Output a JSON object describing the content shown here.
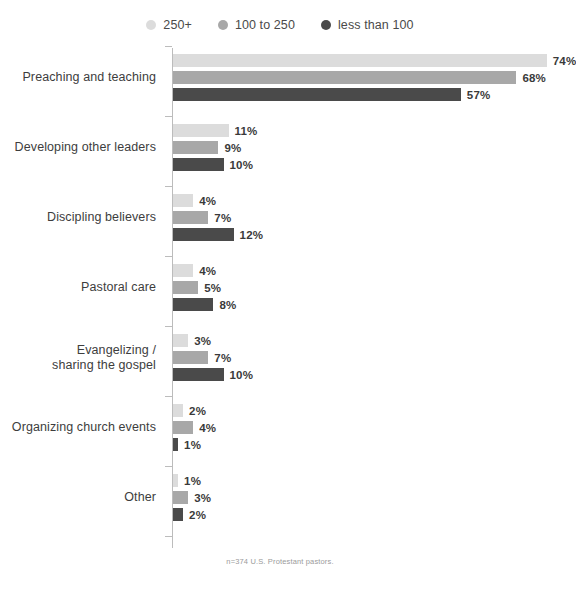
{
  "chart_data": {
    "type": "bar",
    "orientation": "horizontal",
    "title": "",
    "xlabel": "",
    "ylabel": "",
    "xlim": [
      0,
      80
    ],
    "grid": false,
    "legend_position": "top-center",
    "categories": [
      "Preaching and teaching",
      "Developing other leaders",
      "Discipling believers",
      "Pastoral care",
      "Evangelizing /\nsharing the gospel",
      "Organizing church events",
      "Other"
    ],
    "series": [
      {
        "name": "250+",
        "color": "#dcdcdc",
        "values": [
          74,
          11,
          4,
          4,
          3,
          2,
          1
        ],
        "labels": [
          "74%",
          "11%",
          "4%",
          "4%",
          "3%",
          "2%",
          "1%"
        ]
      },
      {
        "name": "100 to 250",
        "color": "#a8a8a8",
        "values": [
          68,
          9,
          7,
          5,
          7,
          4,
          3
        ],
        "labels": [
          "68%",
          "9%",
          "7%",
          "5%",
          "7%",
          "4%",
          "3%"
        ]
      },
      {
        "name": "less than 100",
        "color": "#4a4a4a",
        "values": [
          57,
          10,
          12,
          8,
          10,
          1,
          2
        ],
        "labels": [
          "57%",
          "10%",
          "12%",
          "8%",
          "10%",
          "1%",
          "2%"
        ]
      }
    ],
    "footnote": "n=374 U.S. Protestant pastors."
  },
  "legend": {
    "items": [
      {
        "label": "250+",
        "color": "#dcdcdc"
      },
      {
        "label": "100 to 250",
        "color": "#a8a8a8"
      },
      {
        "label": "less than 100",
        "color": "#4a4a4a"
      }
    ]
  },
  "footnote": {
    "text": "n=374 U.S. Protestant pastors."
  }
}
